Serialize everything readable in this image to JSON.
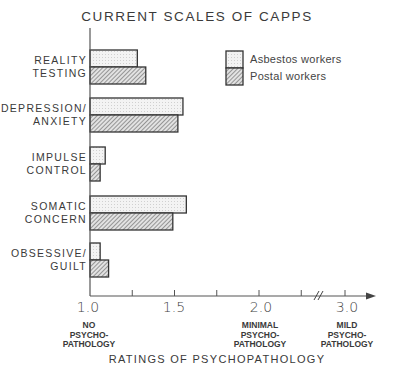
{
  "chart_data": {
    "type": "bar",
    "orientation": "horizontal",
    "title": "CURRENT SCALES OF CAPPS",
    "xlabel": "RATINGS OF PSYCHOPATHOLOGY",
    "ylabel": "",
    "categories": [
      "REALITY TESTING",
      "DEPRESSION/ ANXIETY",
      "IMPULSE CONTROL",
      "SOMATIC CONCERN",
      "OBSESSIVE/ GUILT"
    ],
    "category_labels": [
      "REALITY\nTESTING",
      "DEPRESSION/\nANXIETY",
      "IMPULSE\nCONTROL",
      "SOMATIC\nCONCERN",
      "OBSESSIVE/\nGUILT"
    ],
    "series": [
      {
        "name": "Asbestos workers",
        "pattern": "light-stipple",
        "values": [
          1.28,
          1.55,
          1.09,
          1.57,
          1.06
        ]
      },
      {
        "name": "Postal workers",
        "pattern": "diagonal-hatch",
        "values": [
          1.33,
          1.52,
          1.06,
          1.49,
          1.11
        ]
      }
    ],
    "xlim": [
      1.0,
      3.0
    ],
    "axis_break": "between 2.0 and 3.0",
    "x_ticks": [
      1.0,
      1.25,
      1.5,
      1.75,
      2.0,
      2.25,
      3.0
    ],
    "x_tick_labels": [
      "1.0",
      "1.5",
      "2.0",
      "3.0"
    ],
    "x_anchor_labels": [
      {
        "at": 1.0,
        "text": "NO\nPSYCHO-\nPATHOLOGY"
      },
      {
        "at": 2.0,
        "text": "MINIMAL\nPSYCHO-\nPATHOLOGY"
      },
      {
        "at": 3.0,
        "text": "MILD\nPSYCHO-\nPATHOLOGY"
      }
    ],
    "legend_position": "upper right",
    "grid": false
  },
  "colors": {
    "ink": "#333333",
    "asbestos_fill": "#f1f1f1",
    "postal_fill": "#cfcfcf"
  }
}
